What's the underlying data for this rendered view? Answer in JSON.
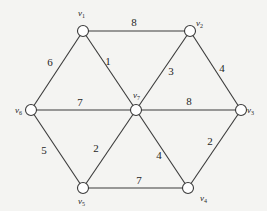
{
  "diagram": {
    "type": "weighted-undirected-graph",
    "colors": {
      "background": "#f4f4f2",
      "stroke": "#3a3a3a",
      "node_fill": "#ffffff",
      "text": "#1e1e1e"
    },
    "nodes": [
      {
        "id": "v1",
        "label": "v",
        "sub": "1",
        "x": 83,
        "y": 31,
        "label_x": 78,
        "label_y": 16,
        "radius": 5.5
      },
      {
        "id": "v2",
        "label": "v",
        "sub": "2",
        "x": 190,
        "y": 31,
        "label_x": 196,
        "label_y": 26,
        "radius": 5.5
      },
      {
        "id": "v3",
        "label": "v",
        "sub": "3",
        "x": 241,
        "y": 110,
        "label_x": 247,
        "label_y": 113,
        "radius": 5.5
      },
      {
        "id": "v4",
        "label": "v",
        "sub": "4",
        "x": 188,
        "y": 188,
        "label_x": 200,
        "label_y": 201,
        "radius": 5.5
      },
      {
        "id": "v5",
        "label": "v",
        "sub": "5",
        "x": 83,
        "y": 188,
        "label_x": 78,
        "label_y": 204,
        "radius": 5.5
      },
      {
        "id": "v6",
        "label": "v",
        "sub": "6",
        "x": 31,
        "y": 110,
        "label_x": 15,
        "label_y": 113,
        "radius": 5.5
      },
      {
        "id": "v7",
        "label": "v",
        "sub": "7",
        "x": 136,
        "y": 110,
        "label_x": 133,
        "label_y": 98,
        "radius": 5.5
      }
    ],
    "edges": [
      {
        "from": "v1",
        "to": "v2",
        "weight": "8",
        "label_x": 134,
        "label_y": 26
      },
      {
        "from": "v1",
        "to": "v6",
        "weight": "6",
        "label_x": 50,
        "label_y": 66
      },
      {
        "from": "v1",
        "to": "v7",
        "weight": "1",
        "label_x": 108,
        "label_y": 65
      },
      {
        "from": "v2",
        "to": "v7",
        "weight": "3",
        "label_x": 171,
        "label_y": 75
      },
      {
        "from": "v2",
        "to": "v3",
        "weight": "4",
        "label_x": 222,
        "label_y": 72
      },
      {
        "from": "v6",
        "to": "v7",
        "weight": "7",
        "label_x": 80,
        "label_y": 106
      },
      {
        "from": "v7",
        "to": "v3",
        "weight": "8",
        "label_x": 189,
        "label_y": 105
      },
      {
        "from": "v6",
        "to": "v5",
        "weight": "5",
        "label_x": 44,
        "label_y": 154
      },
      {
        "from": "v5",
        "to": "v7",
        "weight": "2",
        "label_x": 96,
        "label_y": 152
      },
      {
        "from": "v7",
        "to": "v4",
        "weight": "4",
        "label_x": 159,
        "label_y": 159
      },
      {
        "from": "v3",
        "to": "v4",
        "weight": "2",
        "label_x": 210,
        "label_y": 145
      },
      {
        "from": "v5",
        "to": "v4",
        "weight": "7",
        "label_x": 139,
        "label_y": 184
      }
    ]
  }
}
